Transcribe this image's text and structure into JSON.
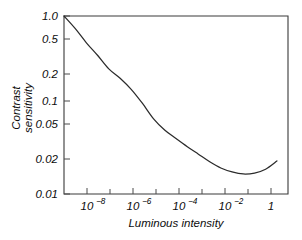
{
  "chart_data": {
    "type": "line",
    "title": "",
    "xlabel": "Luminous intensity",
    "ylabel": "Contrast sensitivity",
    "ylabel_line1": "Contrast",
    "ylabel_line2": "sensitivity",
    "xscale": "log",
    "yscale": "log",
    "xlim": [
      1e-09,
      10
    ],
    "ylim": [
      0.01,
      1.0
    ],
    "grid": false,
    "legend": false,
    "x_tick_labels": [
      "10−8",
      "10−6",
      "10−4",
      "10−2",
      "1"
    ],
    "x_tick_bases": [
      "10",
      "10",
      "10",
      "10",
      "1"
    ],
    "x_tick_exponents": [
      "−8",
      "−6",
      "−4",
      "−2",
      ""
    ],
    "x_tick_values": [
      1e-08,
      1e-06,
      0.0001,
      0.01,
      1
    ],
    "x_minor_tick_values": [
      1e-07,
      1e-05,
      0.001,
      0.1
    ],
    "y_tick_labels": [
      "1.0",
      "0.5",
      "0.2",
      "0.1",
      "0.05",
      "0.02",
      "0.01"
    ],
    "y_tick_values": [
      1.0,
      0.5,
      0.2,
      0.1,
      0.05,
      0.02,
      0.01
    ],
    "series": [
      {
        "name": "Contrast sensitivity vs luminous intensity",
        "x": [
          1e-09,
          3.2e-09,
          1e-08,
          3.2e-08,
          1e-07,
          3.2e-07,
          1e-06,
          3.2e-06,
          1e-05,
          3.2e-05,
          0.0001,
          0.00032,
          0.001,
          0.0032,
          0.01,
          0.032,
          0.1,
          0.32,
          1,
          3.2
        ],
        "y": [
          1.0,
          0.72,
          0.5,
          0.36,
          0.255,
          0.2,
          0.15,
          0.104,
          0.07,
          0.052,
          0.042,
          0.034,
          0.028,
          0.023,
          0.0196,
          0.0177,
          0.0168,
          0.0172,
          0.019,
          0.0235
        ]
      }
    ],
    "annotations": []
  },
  "figure": {
    "background_color": "#ffffff",
    "axis_color": "#3a3a3a",
    "curve_color": "#2b2b2b",
    "text_color": "#0d0d0d"
  }
}
